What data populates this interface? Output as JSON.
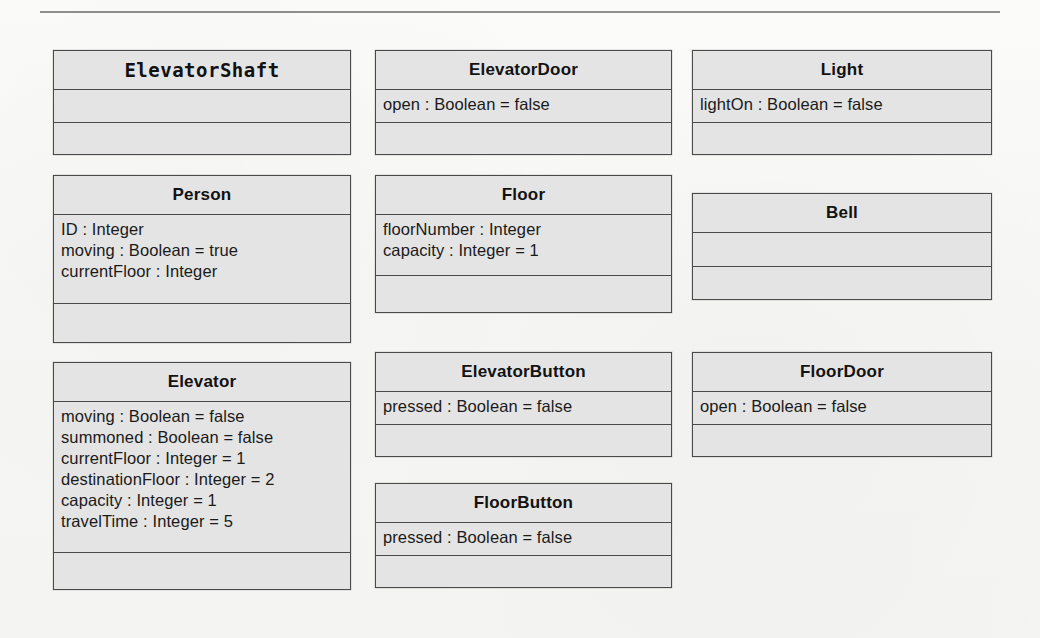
{
  "page": {
    "background_color": "#f7f7f5",
    "box_fill_color": "#e4e4e4",
    "box_border_color": "#4a4a4a",
    "rule_color": "#8e8e8e"
  },
  "diagram": {
    "type": "uml-class-diagram",
    "classes": [
      {
        "name": "ElevatorShaft",
        "name_font": "monospace",
        "attributes": [],
        "operations": [],
        "column": 1,
        "row": 1
      },
      {
        "name": "ElevatorDoor",
        "name_font": "sans-serif",
        "attributes": [
          "open : Boolean = false"
        ],
        "operations": [],
        "column": 2,
        "row": 1
      },
      {
        "name": "Light",
        "name_font": "sans-serif",
        "attributes": [
          "lightOn : Boolean = false"
        ],
        "operations": [],
        "column": 3,
        "row": 1
      },
      {
        "name": "Person",
        "name_font": "sans-serif",
        "attributes": [
          "ID : Integer",
          "moving : Boolean = true",
          "currentFloor : Integer"
        ],
        "operations": [],
        "column": 1,
        "row": 2
      },
      {
        "name": "Floor",
        "name_font": "sans-serif",
        "attributes": [
          "floorNumber : Integer",
          "capacity : Integer = 1"
        ],
        "operations": [],
        "column": 2,
        "row": 2
      },
      {
        "name": "Bell",
        "name_font": "sans-serif",
        "attributes": [],
        "operations": [],
        "column": 3,
        "row": 2
      },
      {
        "name": "Elevator",
        "name_font": "sans-serif",
        "attributes": [
          "moving : Boolean = false",
          "summoned : Boolean = false",
          "currentFloor : Integer = 1",
          "destinationFloor : Integer = 2",
          "capacity : Integer = 1",
          "travelTime : Integer = 5"
        ],
        "operations": [],
        "column": 1,
        "row": 3
      },
      {
        "name": "ElevatorButton",
        "name_font": "sans-serif",
        "attributes": [
          "pressed : Boolean = false"
        ],
        "operations": [],
        "column": 2,
        "row": 3
      },
      {
        "name": "FloorDoor",
        "name_font": "sans-serif",
        "attributes": [
          "open : Boolean = false"
        ],
        "operations": [],
        "column": 3,
        "row": 3
      },
      {
        "name": "FloorButton",
        "name_font": "sans-serif",
        "attributes": [
          "pressed : Boolean = false"
        ],
        "operations": [],
        "column": 2,
        "row": 4
      }
    ]
  },
  "layout": {
    "boxes": [
      {
        "class": "ElevatorShaft",
        "x": 53,
        "y": 50,
        "w": 298,
        "h": 105,
        "name_h": 38,
        "attr_h": 33,
        "ops_h": 32
      },
      {
        "class": "ElevatorDoor",
        "x": 375,
        "y": 50,
        "w": 297,
        "h": 105,
        "name_h": 38,
        "attr_h": 33,
        "ops_h": 32
      },
      {
        "class": "Light",
        "x": 692,
        "y": 50,
        "w": 300,
        "h": 105,
        "name_h": 38,
        "attr_h": 33,
        "ops_h": 32
      },
      {
        "class": "Person",
        "x": 53,
        "y": 175,
        "w": 298,
        "h": 168,
        "name_h": 38,
        "attr_h": 89,
        "ops_h": 39
      },
      {
        "class": "Floor",
        "x": 375,
        "y": 175,
        "w": 297,
        "h": 138,
        "name_h": 38,
        "attr_h": 61,
        "ops_h": 37
      },
      {
        "class": "Bell",
        "x": 692,
        "y": 193,
        "w": 300,
        "h": 107,
        "name_h": 38,
        "attr_h": 34,
        "ops_h": 33
      },
      {
        "class": "Elevator",
        "x": 53,
        "y": 362,
        "w": 298,
        "h": 228,
        "name_h": 38,
        "attr_h": 151,
        "ops_h": 37
      },
      {
        "class": "ElevatorButton",
        "x": 375,
        "y": 352,
        "w": 297,
        "h": 105,
        "name_h": 38,
        "attr_h": 33,
        "ops_h": 32
      },
      {
        "class": "FloorDoor",
        "x": 692,
        "y": 352,
        "w": 300,
        "h": 105,
        "name_h": 38,
        "attr_h": 33,
        "ops_h": 32
      },
      {
        "class": "FloorButton",
        "x": 375,
        "y": 483,
        "w": 297,
        "h": 105,
        "name_h": 38,
        "attr_h": 33,
        "ops_h": 32
      }
    ]
  }
}
